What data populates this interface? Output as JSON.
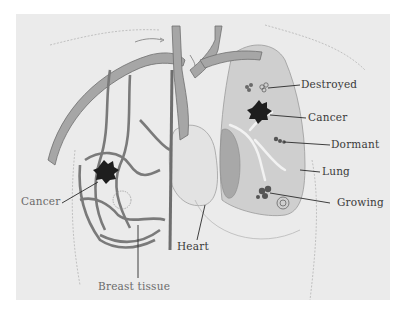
{
  "figure": {
    "background": "#ebebeb",
    "ink_color": "#3a3a3a",
    "vessel_fill": "#a6a6a6",
    "vessel_stroke": "#6e6e6e",
    "tumor_color": "#1e1e1e",
    "lung_shade": "#c8c8c8"
  },
  "labels": {
    "destroyed": "Destroyed",
    "cancer_lung": "Cancer",
    "dormant": "Dormant",
    "lung": "Lung",
    "growing": "Growing",
    "cancer_breast": "Cancer",
    "heart": "Heart",
    "breast_tissue": "Breast tissue"
  },
  "icons": {
    "tumor": "spiky-blob",
    "cell_cluster": "circles-cluster",
    "flow_arrow": "curved-arrow"
  }
}
